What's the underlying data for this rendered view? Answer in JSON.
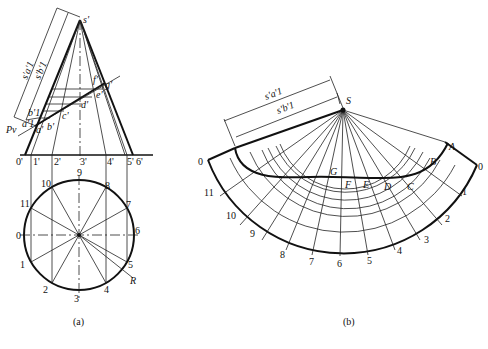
{
  "figure_a": {
    "caption": "(a)",
    "apex_label": "s'",
    "plane_label": "Pv",
    "dim_labels": [
      "s'a'1",
      "s'b'1"
    ],
    "front_points": [
      "a'",
      "b'",
      "c'",
      "d'",
      "e'",
      "f'",
      "g'"
    ],
    "helper_labels": [
      "a'1",
      "b'1"
    ],
    "base_labels": [
      "0'",
      "1'",
      "2'",
      "3'",
      "4'",
      "5'",
      "6'"
    ],
    "circle_labels": [
      "0",
      "1",
      "2",
      "3",
      "4",
      "5",
      "6",
      "7",
      "8",
      "9",
      "10",
      "11"
    ],
    "radius_label": "R"
  },
  "figure_b": {
    "caption": "(b)",
    "apex_label": "S",
    "dim_labels": [
      "s'a'1",
      "s'b'1"
    ],
    "curve_points": [
      "A",
      "B",
      "C",
      "D",
      "E",
      "F",
      "G"
    ],
    "arc_labels": [
      "0",
      "11",
      "10",
      "9",
      "8",
      "7",
      "6",
      "5",
      "4",
      "3",
      "2",
      "1",
      "0"
    ]
  }
}
